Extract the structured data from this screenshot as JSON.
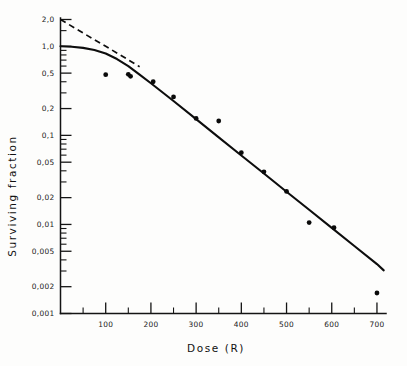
{
  "chart_data": {
    "type": "line",
    "title": "",
    "xlabel": "Dose  (R)",
    "ylabel": "Surviving fraction",
    "xlim": [
      0,
      720
    ],
    "ylim": [
      0.001,
      2.0
    ],
    "yscale": "log",
    "xscale": "linear",
    "grid": false,
    "legend": null,
    "decimal_separator": ",",
    "x_ticks_major": [
      0,
      100,
      200,
      300,
      400,
      500,
      600,
      700
    ],
    "x_tick_labels": [
      "",
      "100",
      "200",
      "300",
      "400",
      "500",
      "600",
      "700"
    ],
    "x_ticks_minor": [
      50,
      150,
      250,
      350,
      450,
      550,
      650
    ],
    "y_ticks_major": [
      2.0,
      1.0,
      0.5,
      0.2,
      0.1,
      0.05,
      0.02,
      0.01,
      0.005,
      0.002,
      0.001
    ],
    "y_tick_labels": [
      "2,0",
      "1,0",
      "0,5",
      "0,2",
      "0,1",
      "0,05",
      "0,02",
      "0,01",
      "0,005",
      "0,002",
      "0,001"
    ],
    "y_ticks_minor": [
      1.5,
      0.9,
      0.8,
      0.7,
      0.6,
      0.4,
      0.3,
      0.09,
      0.08,
      0.07,
      0.06,
      0.04,
      0.03,
      0.009,
      0.008,
      0.007,
      0.006,
      0.004,
      0.003
    ],
    "series": [
      {
        "name": "survival curve",
        "style": "solid",
        "x": [
          0,
          25,
          50,
          75,
          100,
          125,
          150,
          175,
          200,
          250,
          300,
          350,
          400,
          450,
          500,
          550,
          600,
          650,
          700,
          715
        ],
        "y": [
          1.0,
          0.99,
          0.96,
          0.91,
          0.83,
          0.72,
          0.6,
          0.48,
          0.385,
          0.243,
          0.152,
          0.095,
          0.0595,
          0.0373,
          0.0233,
          0.0146,
          0.00915,
          0.00573,
          0.00359,
          0.00305
        ]
      },
      {
        "name": "extrapolation (dashed)",
        "style": "dashed",
        "x": [
          0,
          50,
          100,
          150,
          175
        ],
        "y": [
          2.0,
          1.41,
          1.0,
          0.705,
          0.59
        ]
      }
    ],
    "points": {
      "name": "measured data points",
      "marker": "filled-circle",
      "x": [
        100,
        150,
        155,
        205,
        250,
        300,
        350,
        400,
        450,
        500,
        550,
        605,
        700
      ],
      "y": [
        0.48,
        0.485,
        0.46,
        0.4,
        0.27,
        0.155,
        0.145,
        0.064,
        0.039,
        0.0235,
        0.0105,
        0.0092,
        0.0017
      ]
    },
    "annotations": [],
    "extrapolation_number_n": 2.0
  },
  "axes": {
    "x_title": "Dose  (R)",
    "y_title": "Surviving fraction"
  }
}
